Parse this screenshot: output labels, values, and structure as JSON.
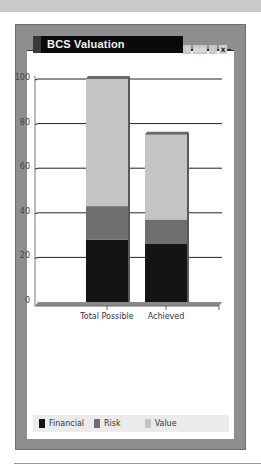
{
  "page": {
    "panel_title": "BCS Valuation",
    "controls": {
      "help": "?",
      "edit": "Edit",
      "minimize": "–",
      "close": "X"
    }
  },
  "colors": {
    "financial": "#141414",
    "risk": "#6f6f6f",
    "value": "#c4c4c4",
    "gridline": "#222222",
    "floor": "#8a8a8a"
  },
  "legend": [
    {
      "label": "Financial",
      "color": "#141414"
    },
    {
      "label": "Risk",
      "color": "#6f6f6f"
    },
    {
      "label": "Value",
      "color": "#c4c4c4"
    }
  ],
  "chart_data": {
    "type": "bar",
    "stacked": true,
    "title": "BCS Valuation",
    "xlabel": "",
    "ylabel": "",
    "ylim": [
      0,
      100
    ],
    "yticks": [
      0,
      20,
      40,
      60,
      80,
      100
    ],
    "grid": true,
    "legend_position": "bottom",
    "categories": [
      "Total Possible",
      "Achieved"
    ],
    "series": [
      {
        "name": "Financial",
        "values": [
          28,
          26
        ]
      },
      {
        "name": "Risk",
        "values": [
          15,
          11
        ]
      },
      {
        "name": "Value",
        "values": [
          57,
          38
        ]
      }
    ]
  }
}
